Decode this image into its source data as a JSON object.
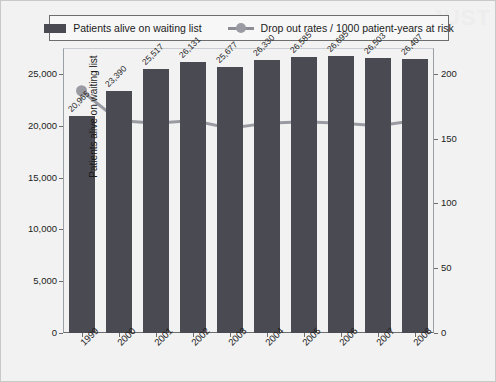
{
  "watermark": "JUST",
  "legend": {
    "items": [
      {
        "label": "Patients alive on waiting list",
        "marker": "bar-swatch",
        "color": "#4a4a52"
      },
      {
        "label": "Drop out rates / 1000 patient-years at risk",
        "marker": "line-marker",
        "color": "#9a9aa2"
      }
    ]
  },
  "chart_data": {
    "type": "bar",
    "title": "",
    "xlabel": "",
    "ylabel": "Patients alive on waiting list",
    "y2label": "Drop out rates / 1000 patient-years at risk",
    "categories": [
      "1999",
      "2000",
      "2001",
      "2002",
      "2003",
      "2004",
      "2005",
      "2006",
      "2007",
      "2008"
    ],
    "ylim": [
      0,
      27500
    ],
    "yticks": [
      0,
      5000,
      10000,
      15000,
      20000,
      25000
    ],
    "ytick_labels": [
      "0",
      "5,000",
      "10,000",
      "15,000",
      "20,000",
      "25,000"
    ],
    "y2lim": [
      0,
      220
    ],
    "y2ticks": [
      0,
      50,
      100,
      150,
      200
    ],
    "y2tick_labels": [
      "0",
      "50",
      "100",
      "150",
      "200"
    ],
    "grid": false,
    "legend_position": "top",
    "series": [
      {
        "name": "Patients alive on waiting list",
        "type": "bar",
        "axis": "left",
        "color": "#4a4a52",
        "values": [
          20965,
          23390,
          25517,
          26131,
          25677,
          26330,
          26585,
          26695,
          26503,
          26407
        ],
        "data_labels": [
          "20,965",
          "23,390",
          "25,517",
          "26,131",
          "25,677",
          "26,330",
          "26,585",
          "26,695",
          "26,503",
          "26,407"
        ]
      },
      {
        "name": "Drop out rates / 1000 patient-years at risk",
        "type": "line",
        "axis": "right",
        "color": "#9a9aa2",
        "values": [
          187,
          164,
          162,
          164,
          158,
          162,
          163,
          162,
          160,
          164
        ]
      }
    ]
  }
}
